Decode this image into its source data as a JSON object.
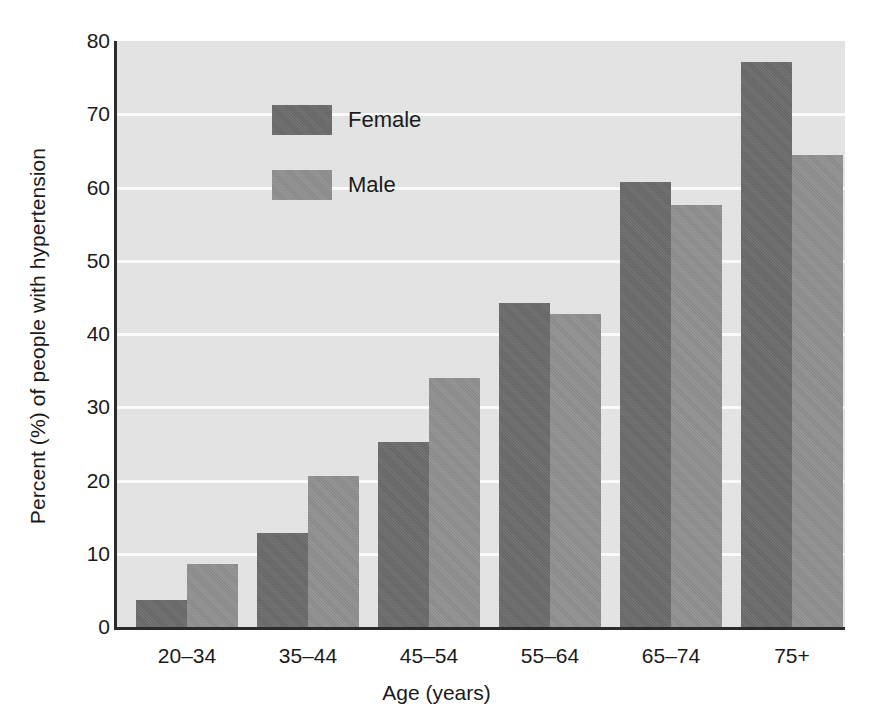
{
  "chart_data": {
    "type": "bar",
    "title": "",
    "xlabel": "Age (years)",
    "ylabel": "Percent (%) of people with hypertension",
    "categories": [
      "20–34",
      "35–44",
      "45–54",
      "55–64",
      "65–74",
      "75+"
    ],
    "series": [
      {
        "name": "Female",
        "color": "#6b6b6b",
        "values": [
          3.7,
          12.8,
          25.3,
          44.2,
          60.8,
          77.2
        ]
      },
      {
        "name": "Male",
        "color": "#909090",
        "values": [
          8.6,
          20.6,
          34.0,
          42.8,
          57.6,
          64.4
        ]
      }
    ],
    "ylim": [
      0,
      80
    ],
    "yticks": [
      0,
      10,
      20,
      30,
      40,
      50,
      60,
      70,
      80
    ],
    "ytick_labels": [
      "0",
      "10",
      "20",
      "30",
      "40",
      "50",
      "60",
      "70",
      "80"
    ],
    "grid": true,
    "grid_axis": "y",
    "grid_color": "#fbfbfb",
    "legend_position": "top-left",
    "plot_background": "#e4e4e4",
    "axis_color": "#2b2b2b"
  }
}
